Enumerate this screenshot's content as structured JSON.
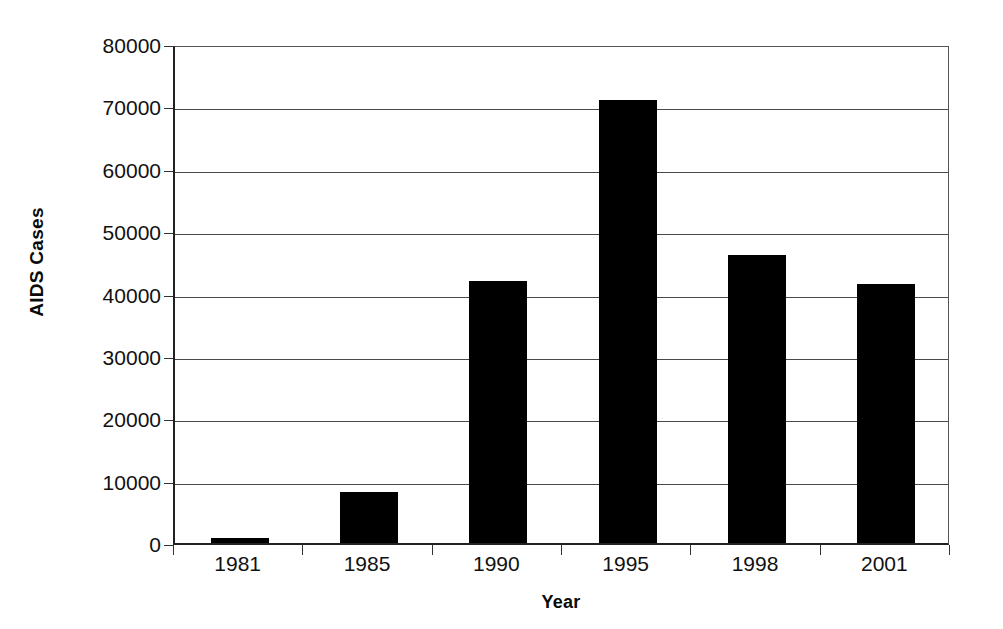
{
  "chart_data": {
    "type": "bar",
    "title": "",
    "xlabel": "Year",
    "ylabel": "AIDS Cases",
    "categories": [
      "1981",
      "1985",
      "1990",
      "1995",
      "1998",
      "2001"
    ],
    "values": [
      800,
      8200,
      42000,
      71000,
      46200,
      41600
    ],
    "series": [
      {
        "name": "AIDS Cases",
        "values": [
          800,
          8200,
          42000,
          71000,
          46200,
          41600
        ],
        "color": "#000000"
      }
    ],
    "ylim": [
      0,
      80000
    ],
    "y_ticks": [
      0,
      10000,
      20000,
      30000,
      40000,
      50000,
      60000,
      70000,
      80000
    ],
    "y_tick_labels": [
      "0",
      "10000",
      "20000",
      "30000",
      "40000",
      "50000",
      "60000",
      "70000",
      "80000"
    ],
    "grid": "horizontal",
    "legend": "none",
    "bar_color": "#000000",
    "plot_background": "#ffffff"
  },
  "axes": {
    "y_title": "AIDS Cases",
    "x_title": "Year"
  }
}
